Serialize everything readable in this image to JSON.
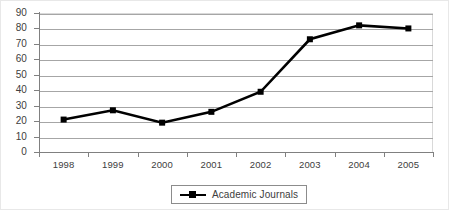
{
  "chart_data": {
    "type": "line",
    "title": "",
    "subtitle": "",
    "xlabel": "",
    "ylabel": "",
    "categories": [
      "1998",
      "1999",
      "2000",
      "2001",
      "2002",
      "2003",
      "2004",
      "2005"
    ],
    "series": [
      {
        "name": "Academic Journals",
        "values": [
          21,
          27,
          19,
          26,
          39,
          73,
          82,
          80
        ],
        "color": "#000000",
        "marker": "square"
      }
    ],
    "ylim": [
      0,
      90
    ],
    "ytick_step": 10,
    "yticks": [
      "90",
      "80",
      "70",
      "60",
      "50",
      "40",
      "30",
      "20",
      "10",
      "0"
    ],
    "grid": "horizontal",
    "legend_position": "bottom",
    "legend_entries": [
      "Academic Journals"
    ]
  },
  "legend": {
    "entry_label": "Academic Journals",
    "marker_name": "line-square-marker"
  }
}
